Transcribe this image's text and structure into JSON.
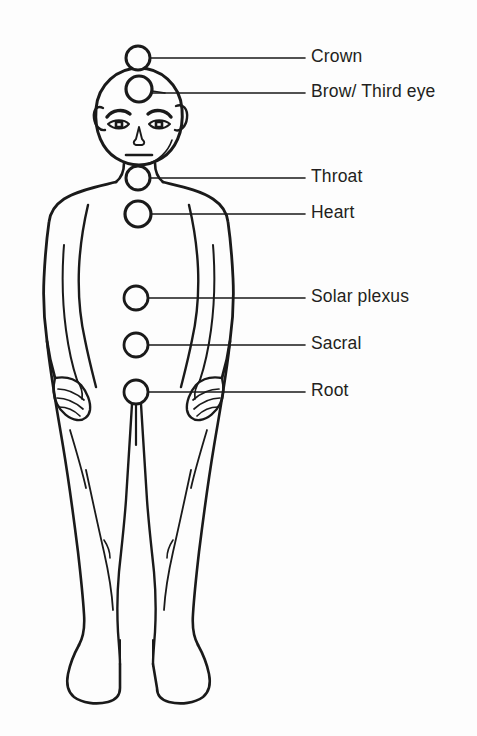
{
  "diagram": {
    "background_color": "#fdfdfd",
    "ink_color": "#1a1a1a",
    "label_color": "#231f20",
    "figure": {
      "name": "human-body-outline",
      "view": "front",
      "style": "line-art"
    },
    "chakras": [
      {
        "id": "crown",
        "label": "Crown",
        "marker_x": 138,
        "marker_y": 58,
        "marker_r": 12,
        "leader_end_x": 305,
        "label_x": 311,
        "label_y": 58
      },
      {
        "id": "brow-third-eye",
        "label": "Brow/ Third eye",
        "marker_x": 139,
        "marker_y": 89,
        "marker_r": 13,
        "leader_end_x": 305,
        "label_x": 311,
        "label_y": 93
      },
      {
        "id": "throat",
        "label": "Throat",
        "marker_x": 138,
        "marker_y": 178,
        "marker_r": 12,
        "leader_end_x": 305,
        "label_x": 311,
        "label_y": 178
      },
      {
        "id": "heart",
        "label": "Heart",
        "marker_x": 138,
        "marker_y": 214,
        "marker_r": 13,
        "leader_end_x": 305,
        "label_x": 311,
        "label_y": 214
      },
      {
        "id": "solar-plexus",
        "label": "Solar plexus",
        "marker_x": 136,
        "marker_y": 298,
        "marker_r": 12,
        "leader_end_x": 305,
        "label_x": 311,
        "label_y": 298
      },
      {
        "id": "sacral",
        "label": "Sacral",
        "marker_x": 136,
        "marker_y": 345,
        "marker_r": 12,
        "leader_end_x": 305,
        "label_x": 311,
        "label_y": 345
      },
      {
        "id": "root",
        "label": "Root",
        "marker_x": 136,
        "marker_y": 392,
        "marker_r": 12,
        "leader_end_x": 305,
        "label_x": 311,
        "label_y": 392
      }
    ]
  }
}
